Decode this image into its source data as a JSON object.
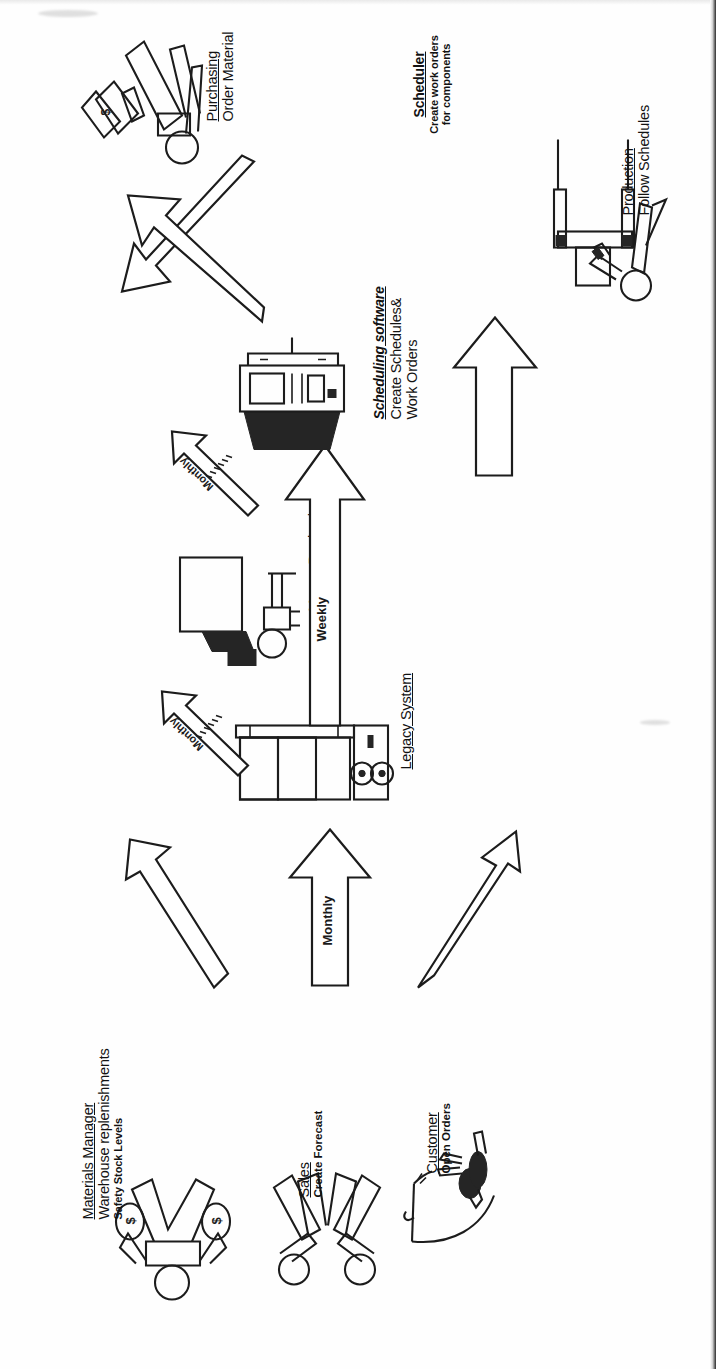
{
  "diagram": {
    "orientation": "rotated-90-ccw",
    "nodes": [
      {
        "id": "materials-manager",
        "line1": "Materials Manager",
        "line2": "Warehouse replenishments",
        "line3": "Safety Stock Levels",
        "icon": "two-person-with-money-bags-figure"
      },
      {
        "id": "sales",
        "line1": "Sales",
        "line2": "Create Forecast",
        "line3": "",
        "icon": "two-stick-figures"
      },
      {
        "id": "customer",
        "line1": "Customer",
        "line2": "Open Orders",
        "line3": "",
        "icon": "customer-figure-with-phone"
      },
      {
        "id": "legacy-system",
        "line1": "Legacy System",
        "line2": "",
        "line3": "",
        "icon": "mainframe-computer-icon"
      },
      {
        "id": "master-production-scheduling",
        "line1": "Master Production",
        "line1b": "Scheduling",
        "line2": "",
        "line3": "",
        "icon": "person-at-desk-icon"
      },
      {
        "id": "scheduling-software",
        "line1": "Scheduling software",
        "line2": "Create Schedules&",
        "line3": "Work Orders",
        "icon": "desktop-computer-icon"
      },
      {
        "id": "purchasing",
        "line1": "Purchasing",
        "line2": "Order Material",
        "line3": "",
        "icon": "person-with-papers-figure"
      },
      {
        "id": "scheduler",
        "line1": "Scheduler",
        "line2": "Create work orders",
        "line3": "for components",
        "icon": "none"
      },
      {
        "id": "production",
        "line1": "Production",
        "line2": "Follow Schedules",
        "line3": "",
        "icon": "worker-at-machine-figure"
      }
    ],
    "arrows": [
      {
        "id": "materials-to-legacy",
        "label": ""
      },
      {
        "id": "sales-to-legacy",
        "label": "Monthly"
      },
      {
        "id": "customer-to-legacy",
        "label": ""
      },
      {
        "id": "legacy-to-mps",
        "label": "Monthly"
      },
      {
        "id": "mps-to-software",
        "label": "Monthly"
      },
      {
        "id": "legacy-to-software-weekly",
        "label": "Weekly"
      },
      {
        "id": "software-to-purchasing",
        "label": ""
      },
      {
        "id": "software-to-scheduler",
        "label": ""
      },
      {
        "id": "software-to-production",
        "label": ""
      }
    ],
    "colors": {
      "ink": "#1c1c1c",
      "paper": "#ffffff",
      "fill_dark": "#252525"
    }
  }
}
